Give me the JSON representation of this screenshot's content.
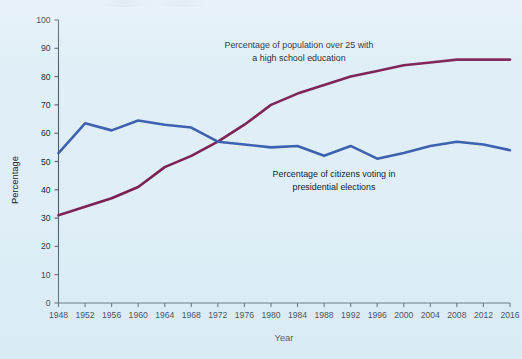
{
  "figure": {
    "background_color": "#dfeef7",
    "axis_color": "#4b5c68",
    "x_axis_title": "Year",
    "y_axis_title": "Percentage"
  },
  "annotations": {
    "purple": {
      "line1": "Percentage of population over 25 with",
      "line2": "a high school education"
    },
    "blue": {
      "line1": "Percentage of citizens voting in",
      "line2": "presidential elections"
    }
  },
  "chart_data": {
    "type": "line",
    "title": "",
    "xlabel": "Year",
    "ylabel": "Percentage",
    "xlim": [
      1948,
      2016
    ],
    "ylim": [
      0,
      100
    ],
    "grid": false,
    "legend_position": "inline-annotation",
    "x": [
      1948,
      1952,
      1956,
      1960,
      1964,
      1968,
      1972,
      1976,
      1980,
      1984,
      1988,
      1992,
      1996,
      2000,
      2004,
      2008,
      2012,
      2016
    ],
    "xticks": [
      "1948",
      "1952",
      "1956",
      "1960",
      "1964",
      "1968",
      "1972",
      "1976",
      "1980",
      "1984",
      "1988",
      "1992",
      "1996",
      "2000",
      "2004",
      "2008",
      "2012",
      "2016"
    ],
    "yticks": [
      "0",
      "10",
      "20",
      "30",
      "40",
      "50",
      "60",
      "70",
      "80",
      "90",
      "100"
    ],
    "series": [
      {
        "name": "Percentage of population over 25 with a high school education",
        "color": "#7b1f52",
        "values": [
          31,
          34,
          37,
          41,
          48,
          52,
          57,
          63,
          70,
          74,
          77,
          80,
          82,
          84,
          85,
          86,
          86,
          86
        ]
      },
      {
        "name": "Percentage of citizens voting in presidential elections",
        "color": "#3a5fae",
        "values": [
          53,
          63.5,
          61,
          64.5,
          63,
          62,
          57,
          56,
          55,
          55.5,
          52,
          55.5,
          51,
          53,
          55.5,
          57,
          56,
          54
        ]
      }
    ]
  }
}
